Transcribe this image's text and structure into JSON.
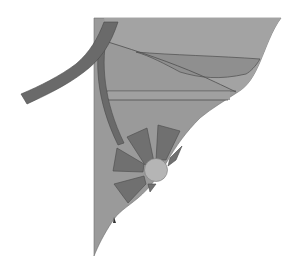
{
  "title": "Abstract geometric composition",
  "colors": {
    "background": "#ffffff",
    "main_fill": "#9a9a9a",
    "upper_band": "#a4a4a4",
    "lens": "#8c8c8c",
    "dark_band": "#6a6a6a",
    "wedge": "#707070",
    "sun": "#b4b4b4",
    "line": "#505050"
  },
  "shapes": {
    "main_triangle": "main-triangle",
    "outer_arc": "outer-arc-band",
    "inner_arc": "inner-arc-band",
    "sun_circle": "sun-circle",
    "wedge_count": 6
  }
}
